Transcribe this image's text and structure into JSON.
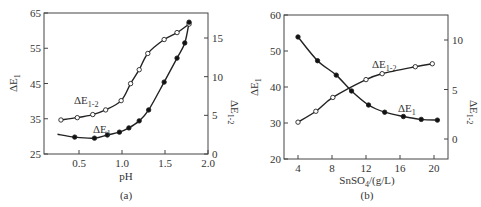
{
  "chart_data": [
    {
      "panel": "(a)",
      "type": "line",
      "xlabel": "pH",
      "ylabel": "ΔE1",
      "y2label": "ΔE1-2",
      "xlim": [
        0.0,
        2.0
      ],
      "ylim": [
        25,
        65
      ],
      "y2lim": [
        0,
        18
      ],
      "xticks": [
        "0.5",
        "1.0",
        "1.5",
        "2.0"
      ],
      "yticks": [
        "25",
        "35",
        "45",
        "55",
        "65"
      ],
      "y2ticks": [
        "0",
        "5",
        "10",
        "15"
      ],
      "grid": false,
      "series": [
        {
          "name": "ΔE1-2",
          "axis": "right",
          "marker": "open-circle",
          "x": [
            0.29,
            0.48,
            0.66,
            0.81,
            0.99,
            1.1,
            1.2,
            1.3,
            1.49,
            1.64,
            1.78
          ],
          "y": [
            4.4,
            4.7,
            5.1,
            5.7,
            6.9,
            9.1,
            10.9,
            13.0,
            14.8,
            15.7,
            16.8
          ]
        },
        {
          "name": "ΔE1",
          "axis": "left",
          "marker": "filled-circle",
          "x": [
            0.45,
            0.68,
            0.83,
            0.97,
            1.08,
            1.2,
            1.31,
            1.49,
            1.64,
            1.73,
            1.78
          ],
          "y": [
            29.8,
            29.5,
            30.4,
            31.2,
            32.4,
            34.4,
            37.5,
            45.4,
            52.2,
            56.5,
            62.4
          ]
        }
      ],
      "annotations": [
        "ΔE1-2",
        "ΔE1"
      ]
    },
    {
      "panel": "(b)",
      "type": "line",
      "xlabel": "SnSO4/(g/L)",
      "ylabel": "ΔE1",
      "y2label": "ΔE1-2",
      "xlim": [
        2.5,
        22
      ],
      "ylim": [
        20,
        60
      ],
      "y2lim": [
        -2,
        12
      ],
      "xticks": [
        "4",
        "8",
        "12",
        "16",
        "20"
      ],
      "yticks": [
        "20",
        "30",
        "40",
        "50",
        "60"
      ],
      "y2ticks": [
        "0",
        "5",
        "10"
      ],
      "grid": false,
      "series": [
        {
          "name": "ΔE1",
          "axis": "left",
          "marker": "filled-circle",
          "x": [
            4.0,
            6.3,
            8.5,
            10.3,
            12.3,
            14.2,
            16.4,
            18.5,
            20.4
          ],
          "y": [
            53.9,
            47.3,
            43.3,
            38.9,
            35.0,
            33.0,
            31.8,
            31.0,
            30.8
          ]
        },
        {
          "name": "ΔE1-2",
          "axis": "right",
          "marker": "open-circle",
          "x": [
            4.0,
            6.1,
            8.1,
            12.0,
            13.9,
            17.8,
            19.8
          ],
          "y": [
            1.7,
            2.8,
            4.2,
            6.0,
            6.6,
            7.3,
            7.6
          ]
        }
      ],
      "annotations": [
        "ΔE1-2",
        "ΔE1"
      ]
    }
  ],
  "labels": {
    "a": {
      "ylabel": "ΔE",
      "ysub": "1",
      "y2label": "ΔE",
      "y2sub": "1-2",
      "xlabel": "pH",
      "caption": "(a)",
      "ann_e12": "ΔE",
      "ann_e12_sub": "1-2",
      "ann_e1": "ΔE",
      "ann_e1_sub": "1"
    },
    "b": {
      "ylabel": "ΔE",
      "ysub": "1",
      "y2label": "ΔE",
      "y2sub": "1-2",
      "xlabel_main": "SnSO",
      "xlabel_sub": "4",
      "xlabel_tail": "/(g/L)",
      "caption": "(b)",
      "ann_e12": "ΔE",
      "ann_e12_sub": "1-2",
      "ann_e1": "ΔE",
      "ann_e1_sub": "1"
    }
  }
}
